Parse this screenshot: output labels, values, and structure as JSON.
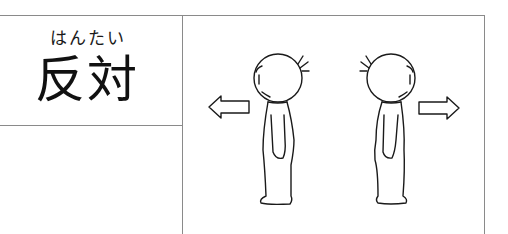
{
  "card": {
    "furigana": "はんたい",
    "word": "反対",
    "illustration": {
      "description": "Two stick figures standing back-to-back, each with an arrow pointing away in opposite directions",
      "left_arrow": "arrow-left-icon",
      "right_arrow": "arrow-right-icon"
    }
  },
  "colors": {
    "line": "#8a8a8a",
    "ink": "#111111",
    "background": "#ffffff"
  }
}
